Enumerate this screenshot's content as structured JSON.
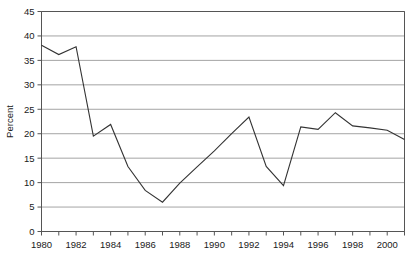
{
  "chart_data": {
    "type": "line",
    "title": "",
    "xlabel": "",
    "ylabel": "Percent",
    "xlim": [
      1980,
      2001
    ],
    "ylim": [
      0,
      45
    ],
    "ytick_step": 5,
    "xtick_step": 1,
    "xticklabel_step": 2,
    "grid": "horizontal",
    "legend": "none",
    "line_color": "#333333",
    "grid_color": "#9a9a9a",
    "axis_color": "#555555",
    "background_color": "#ffffff",
    "yticks": [
      0,
      5,
      10,
      15,
      20,
      25,
      30,
      35,
      40,
      45
    ],
    "ytick_labels": [
      "0",
      "5",
      "10",
      "15",
      "20",
      "25",
      "30",
      "35",
      "40",
      "45"
    ],
    "xticks": [
      1980,
      1981,
      1982,
      1983,
      1984,
      1985,
      1986,
      1987,
      1988,
      1989,
      1990,
      1991,
      1992,
      1993,
      1994,
      1995,
      1996,
      1997,
      1998,
      1999,
      2000,
      2001
    ],
    "xtick_labels": [
      "1980",
      "",
      "1982",
      "",
      "1984",
      "",
      "1986",
      "",
      "1988",
      "",
      "1990",
      "",
      "1992",
      "",
      "1994",
      "",
      "1996",
      "",
      "1998",
      "",
      "2000",
      ""
    ],
    "x": [
      1980,
      1981,
      1982,
      1983,
      1984,
      1985,
      1986,
      1987,
      1988,
      1989,
      1990,
      1991,
      1992,
      1993,
      1994,
      1995,
      1996,
      1997,
      1998,
      1999,
      2000,
      2001
    ],
    "values": [
      38.1,
      36.2,
      37.8,
      19.5,
      21.9,
      13.3,
      8.4,
      6.0,
      9.9,
      13.2,
      16.5,
      20.0,
      23.4,
      13.3,
      9.4,
      21.4,
      20.9,
      24.3,
      21.6,
      21.2,
      20.7,
      18.8
    ],
    "series": [
      {
        "name": "Percent",
        "values": [
          38.1,
          36.2,
          37.8,
          19.5,
          21.9,
          13.3,
          8.4,
          6.0,
          9.9,
          13.2,
          16.5,
          20.0,
          23.4,
          13.3,
          9.4,
          21.4,
          20.9,
          24.3,
          21.6,
          21.2,
          20.7,
          18.8
        ]
      }
    ]
  }
}
